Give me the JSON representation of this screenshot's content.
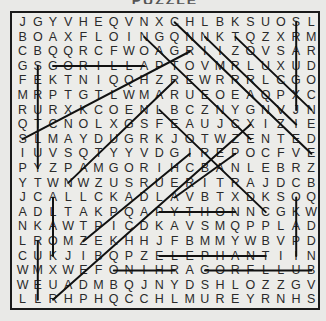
{
  "puzzle": {
    "title": "PUZZLE",
    "rows": [
      "JGYVHEQVNXCHLBKSUOSL",
      "BOAXFLOINGQNNKTQZXRM",
      "CBQQRCFWOAGRIIZOVSAR",
      "GSGORILLAPTOVMRLUXUD",
      "FEKTNIQQHZREWRRRLCGO",
      "MRPTGTLWMARUEOEAQPXC",
      "RURXKCOENLBCZNYGNVJN",
      "QTCNOLXGSFEAUJCXIZIE",
      "SLMAYDUGRKJOTWZENTED",
      "IUVSQTYYVDGIREPOCFVE",
      "PYZPAMGORIHCBANLEBRZ",
      "YTWNWZUSRUERITRAJDCB",
      "JCALLCKADLAVBTXDKSOQ",
      "ADLTAKPQAPYTHONNCGKW",
      "NKAWTPICDKAVSMQPPLAD",
      "LROMZEKHHJFBMMYWBVPD",
      "CUKJIBQPZELEPHANTIIN",
      "WMXWEFONIHRAGORFLLUB",
      "WEUADMBQJNYDSHLOZZGV",
      "LLRHPHQCCHLMUREYRNHS"
    ],
    "found_marks": [
      {
        "from": [
          2,
          3
        ],
        "to": [
          8,
          3
        ]
      },
      {
        "from": [
          9,
          13
        ],
        "to": [
          14,
          13
        ]
      },
      {
        "from": [
          9,
          16
        ],
        "to": [
          16,
          16
        ]
      },
      {
        "from": [
          6,
          17
        ],
        "to": [
          10,
          17
        ]
      },
      {
        "from": [
          12,
          17
        ],
        "to": [
          19,
          17
        ]
      },
      {
        "from": [
          1,
          3
        ],
        "to": [
          1,
          10
        ]
      },
      {
        "from": [
          18,
          0
        ],
        "to": [
          18,
          6
        ]
      },
      {
        "from": [
          2,
          12
        ],
        "to": [
          2,
          16
        ]
      },
      {
        "from": [
          1,
          15
        ],
        "to": [
          1,
          19
        ]
      },
      {
        "from": [
          18,
          12
        ],
        "to": [
          18,
          16
        ]
      },
      {
        "from": [
          10,
          0
        ],
        "to": [
          19,
          9
        ]
      },
      {
        "from": [
          8,
          1
        ],
        "to": [
          15,
          8
        ]
      },
      {
        "from": [
          12,
          1
        ],
        "to": [
          18,
          7
        ]
      },
      {
        "from": [
          14,
          1
        ],
        "to": [
          19,
          6
        ]
      },
      {
        "from": [
          9,
          6
        ],
        "to": [
          16,
          13
        ]
      },
      {
        "from": [
          0,
          8
        ],
        "to": [
          11,
          2
        ]
      },
      {
        "from": [
          3,
          11
        ],
        "to": [
          10,
          4
        ]
      },
      {
        "from": [
          4,
          15
        ],
        "to": [
          11,
          9
        ]
      },
      {
        "from": [
          2,
          19
        ],
        "to": [
          15,
          7
        ]
      },
      {
        "from": [
          10,
          12
        ],
        "to": [
          14,
          9
        ]
      }
    ]
  }
}
